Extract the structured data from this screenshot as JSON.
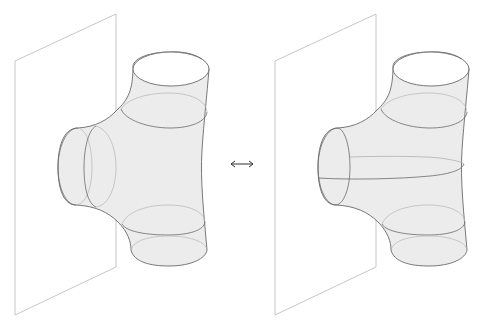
{
  "figure": {
    "panels": [
      {
        "id": "left",
        "plane": {
          "points": "15,61 116,14 116,267 15,315"
        },
        "offset_x": 0,
        "features": [
          "two vertical rings on side branch",
          "top ring",
          "bottom ring"
        ]
      },
      {
        "id": "right",
        "plane": {
          "points": "35,61 136,14 136,267 35,315"
        },
        "offset_x": 240,
        "features": [
          "horizontal seam along side branch",
          "top ring",
          "bottom ring"
        ]
      }
    ],
    "relation_symbol": "⟷",
    "colors": {
      "surface_fill": "#ececec",
      "outline": "#6a6a6a",
      "plane_stroke": "#b8b8b8",
      "background": "#ffffff"
    }
  }
}
